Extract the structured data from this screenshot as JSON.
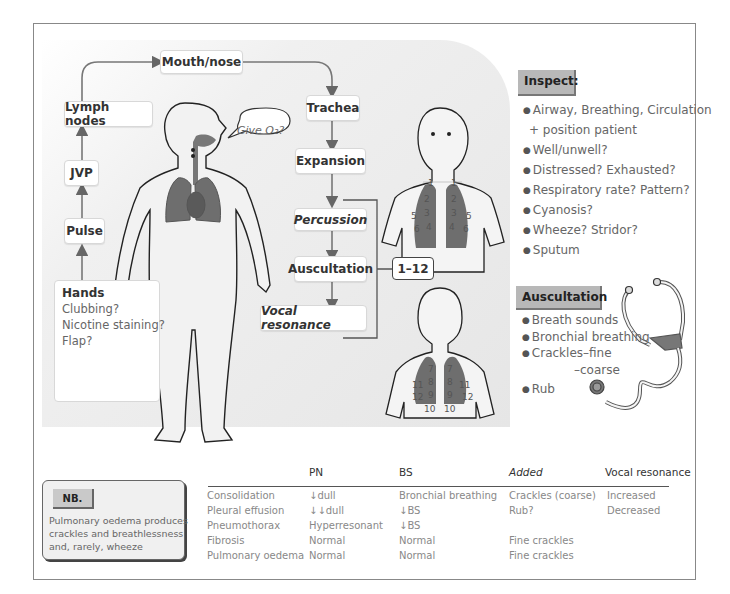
{
  "flow": {
    "mouth_nose": "Mouth/nose",
    "lymph_nodes": "Lymph nodes",
    "jvp": "JVP",
    "pulse": "Pulse",
    "trachea": "Trachea",
    "expansion": "Expansion",
    "percussion": "Percussion",
    "auscultation": "Auscultation",
    "vocal_resonance": "Vocal resonance",
    "bracket_label": "1–12"
  },
  "speech_bubble": "Give O₂?",
  "hands": {
    "title": "Hands",
    "items": [
      "Clubbing?",
      "Nicotine staining?",
      "Flap?"
    ]
  },
  "front_chest_numbers": [
    "1",
    "1",
    "2",
    "2",
    "3",
    "3",
    "4",
    "4",
    "5",
    "5",
    "6",
    "6"
  ],
  "back_chest_numbers": [
    "7",
    "7",
    "8",
    "8",
    "9",
    "9",
    "10",
    "10",
    "11",
    "11",
    "12",
    "12"
  ],
  "inspect": {
    "heading": "Inspect:",
    "items": [
      "Airway, Breathing, Circulation",
      "+ position patient",
      "Well/unwell?",
      "Distressed? Exhausted?",
      "Respiratory rate? Pattern?",
      "Cyanosis?",
      "Wheeze? Stridor?",
      "Sputum"
    ]
  },
  "auscultation_panel": {
    "heading": "Auscultation",
    "items": [
      "Breath sounds",
      "Bronchial breathing",
      "Crackles–fine",
      "–coarse",
      "Rub"
    ]
  },
  "nb": {
    "tag": "NB.",
    "lines": [
      "Pulmonary oedema produces",
      "crackles and breathlessness",
      "and, rarely, wheeze"
    ]
  },
  "table": {
    "headers": [
      "",
      "PN",
      "BS",
      "Added",
      "Vocal resonance"
    ],
    "rows": [
      [
        "Consolidation",
        "↓dull",
        "Bronchial breathing",
        "Crackles (coarse)",
        "Increased"
      ],
      [
        "Pleural effusion",
        "↓↓dull",
        "↓BS",
        "Rub?",
        "Decreased"
      ],
      [
        "Pneumothorax",
        "Hyperresonant",
        "↓BS",
        "",
        ""
      ],
      [
        "Fibrosis",
        "Normal",
        "Normal",
        "Fine crackles",
        ""
      ],
      [
        "Pulmonary oedema",
        "Normal",
        "Normal",
        "Fine crackles",
        ""
      ]
    ]
  },
  "colors": {
    "lung": "#6e6e6e",
    "panel": "#e6e6e6",
    "heading_tag": "#b8b8b8",
    "arrow": "#666666"
  }
}
